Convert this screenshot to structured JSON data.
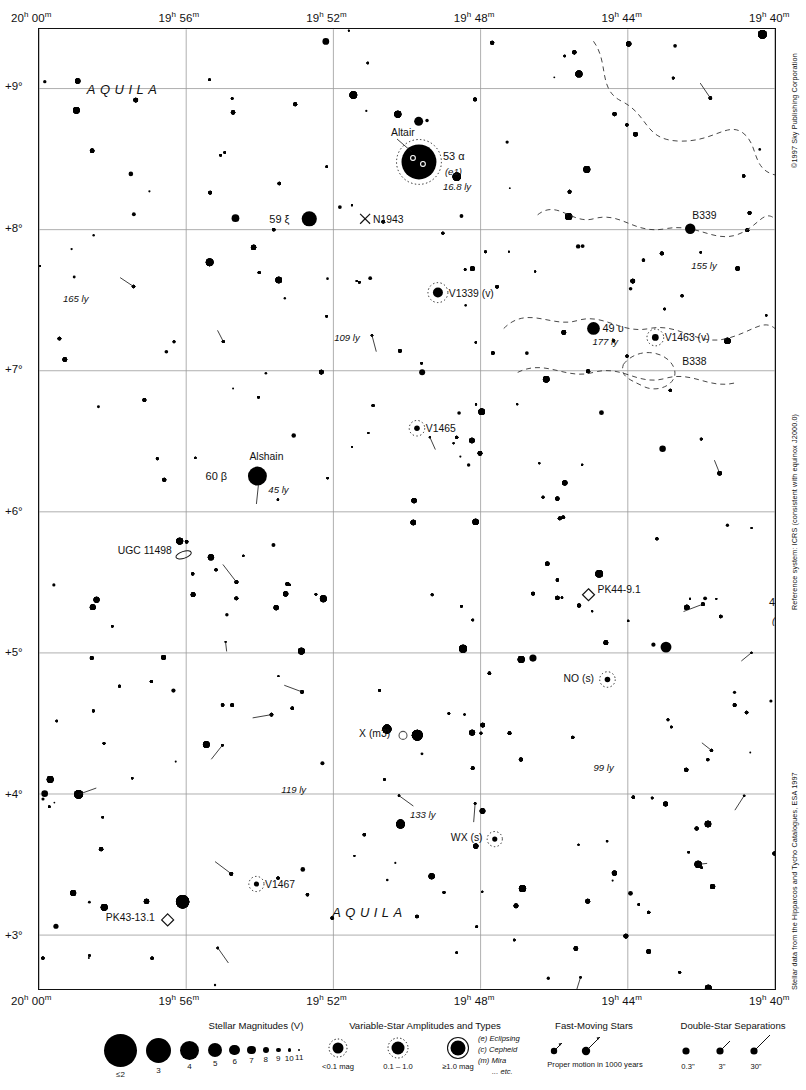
{
  "page": {
    "number": "1267",
    "next_page_folio": "1291",
    "constellation_primary": "AQUILA",
    "constellation_secondary": "AQUILA"
  },
  "credits": {
    "copyright": "©1997 Sky Publishing Corporation",
    "reference_system": "Reference system: ICRS (consistent with equinox J2000.0)",
    "data_source": "Stellar data from the Hipparcos and Tycho Catalogues, ESA 1997"
  },
  "axes": {
    "ra_labels": [
      "20h 00m",
      "19h 56m",
      "19h 52m",
      "19h 48m",
      "19h 44m",
      "19h 40m"
    ],
    "ra_hours": [
      "20",
      "19",
      "19",
      "19",
      "19",
      "19"
    ],
    "ra_minutes": [
      "00",
      "56",
      "52",
      "48",
      "44",
      "40"
    ],
    "dec_labels": [
      "+9°",
      "+8°",
      "+7°",
      "+6°",
      "+5°",
      "+4°",
      "+3°"
    ],
    "ra_range_hours": [
      20.0,
      19.6667
    ],
    "dec_range_deg": [
      2.62,
      9.42
    ]
  },
  "chart_data": {
    "type": "scatter",
    "xlabel": "Right Ascension",
    "ylabel": "Declination",
    "xlim": [
      "20h 00m",
      "19h 40m"
    ],
    "ylim": [
      "+2.62°",
      "+9.42°"
    ],
    "grid": true,
    "grid_ra_lines": [
      "20h 00m",
      "19h 56m",
      "19h 52m",
      "19h 48m",
      "19h 44m",
      "19h 40m"
    ],
    "grid_dec_lines": [
      "+9°",
      "+8°",
      "+7°",
      "+6°",
      "+5°",
      "+4°",
      "+3°"
    ],
    "magnitude_scale": {
      "mags": [
        "≤2",
        "3",
        "4",
        "5",
        "6",
        "7",
        "8",
        "9",
        "10",
        "11"
      ],
      "radii_px": [
        16.5,
        12.5,
        9.5,
        7.2,
        5.4,
        4.2,
        3.2,
        2.3,
        1.7,
        1.2
      ]
    },
    "labeled_objects": [
      {
        "name": "Altair",
        "label": "Altair",
        "bayer": "53 α",
        "type_code": "(e1)",
        "distance": "16.8 ly",
        "mag": 0.76,
        "x_px": 381,
        "y_px": 133,
        "r_px": 17.5,
        "variable_ring": "dotted",
        "double": true
      },
      {
        "name": "Alshain",
        "label": "Alshain",
        "bayer": "60 β",
        "distance": "45 ly",
        "mag": 3.7,
        "x_px": 219,
        "y_px": 448,
        "r_px": 9.5,
        "double": true
      },
      {
        "name": "59 xi",
        "label": "59 ξ",
        "mag": 4.7,
        "x_px": 271,
        "y_px": 190,
        "r_px": 7.6
      },
      {
        "name": "49 upsilon",
        "label": "49 υ",
        "distance": "177 ly",
        "mag": 5.2,
        "x_px": 556,
        "y_px": 300,
        "r_px": 6.4
      },
      {
        "name": "44 sigma",
        "label": "44 σ",
        "type_code": "(e1)",
        "mag": 5.2,
        "x_px": 770,
        "y_px": 582,
        "r_px": 7.2,
        "variable_ring": "dotted"
      },
      {
        "name": "V1339",
        "label": "V1339 (v)",
        "mag": 6.0,
        "x_px": 400,
        "y_px": 264,
        "r_px": 5.0,
        "variable_ring": "dotted"
      },
      {
        "name": "V1463",
        "label": "V1463 (v)",
        "mag": 7.5,
        "x_px": 618,
        "y_px": 309,
        "r_px": 3.4,
        "variable_ring": "dotted"
      },
      {
        "name": "V1465",
        "label": "V1465",
        "mag": 8.0,
        "x_px": 379,
        "y_px": 400,
        "r_px": 2.8,
        "variable_ring": "dotted"
      },
      {
        "name": "V1467",
        "label": "V1467",
        "mag": 8.2,
        "x_px": 218,
        "y_px": 857,
        "r_px": 2.6,
        "variable_ring": "dotted"
      },
      {
        "name": "NO Aquilae",
        "label": "NO (s)",
        "mag": 8.0,
        "x_px": 570,
        "y_px": 652,
        "r_px": 2.8,
        "variable_ring": "dotted"
      },
      {
        "name": "WX Aquilae",
        "label": "WX (s)",
        "mag": 8.4,
        "x_px": 457,
        "y_px": 812,
        "r_px": 2.6,
        "variable_ring": "dotted"
      },
      {
        "name": "X Aquilae",
        "label": "X (m3)",
        "mag": 9.0,
        "x_px": 365,
        "y_px": 708,
        "r_px": 4.0,
        "variable_ring": "open"
      },
      {
        "name": "B339",
        "label": "B339",
        "object_type": "dark-nebula",
        "distance": "155 ly",
        "x_px": 653,
        "y_px": 200,
        "r_px": 5.2
      },
      {
        "name": "B338",
        "label": "B338",
        "object_type": "dark-nebula",
        "x_px": 655,
        "y_px": 331
      },
      {
        "name": "N1943",
        "label": "N1943",
        "object_type": "cluster-x",
        "x_px": 327,
        "y_px": 190
      },
      {
        "name": "UGC 11498",
        "label": "UGC 11498",
        "object_type": "galaxy",
        "x_px": 145,
        "y_px": 527
      },
      {
        "name": "PK44-9.1",
        "label": "PK44-9.1",
        "object_type": "planetary-nebula",
        "x_px": 551,
        "y_px": 567
      },
      {
        "name": "PK43-13.1",
        "label": "PK43-13.1",
        "object_type": "planetary-nebula",
        "x_px": 129,
        "y_px": 893
      }
    ],
    "distance_annotations": [
      {
        "text": "165 ly",
        "x_px": 24,
        "y_px": 273
      },
      {
        "text": "109 ly",
        "x_px": 296,
        "y_px": 313
      },
      {
        "text": "155 ly",
        "x_px": 660,
        "y_px": 234
      },
      {
        "text": "177 ly",
        "x_px": 557,
        "y_px": 311
      },
      {
        "text": "16.8 ly",
        "x_px": 405,
        "y_px": 155
      },
      {
        "text": "45 ly",
        "x_px": 238,
        "y_px": 466
      },
      {
        "text": "119 ly",
        "x_px": 243,
        "y_px": 766
      },
      {
        "text": "133 ly",
        "x_px": 372,
        "y_px": 791
      },
      {
        "text": "99 ly",
        "x_px": 556,
        "y_px": 744
      }
    ]
  },
  "legend": {
    "magnitudes": {
      "title": "Stellar Magnitudes (V)",
      "labels": [
        "≤2",
        "3",
        "4",
        "5",
        "6",
        "7",
        "8",
        "9",
        "10",
        "11"
      ]
    },
    "variables": {
      "title": "Variable-Star Amplitudes and Types",
      "amplitudes": [
        "<0.1 mag",
        "0.1 – 1.0",
        "≥1.0 mag"
      ],
      "types": [
        "(e)  Eclipsing",
        "(c)  Cepheid",
        "(m)  Mira",
        "... etc."
      ]
    },
    "fast_moving": {
      "title": "Fast-Moving Stars",
      "caption": "Proper motion in 1000 years"
    },
    "doubles": {
      "title": "Double-Star Separations",
      "separations": [
        "0.3\"",
        "3\"",
        "30\""
      ]
    }
  }
}
